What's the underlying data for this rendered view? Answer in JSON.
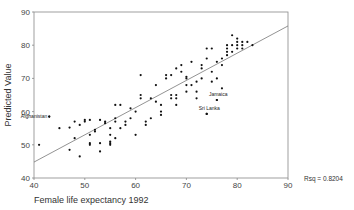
{
  "chart_data": {
    "type": "scatter",
    "title": "",
    "xlabel": "Female life expectancy 1992",
    "ylabel": "Predicted Value",
    "xlim": [
      40,
      90
    ],
    "ylim": [
      40,
      90
    ],
    "xticks": [
      40,
      50,
      60,
      70,
      80,
      90
    ],
    "yticks": [
      40,
      50,
      60,
      70,
      80,
      90
    ],
    "grid": false,
    "legend": null,
    "fit_line": {
      "x": [
        40,
        90
      ],
      "y": [
        44.8,
        85.8
      ]
    },
    "rsq_label": "Rsq = 0.8204",
    "annotations": [
      {
        "label": "Afghanistan",
        "x": 43,
        "y": 58.5
      },
      {
        "label": "Jamaica",
        "x": 76,
        "y": 63.5
      },
      {
        "label": "Sri Lanka",
        "x": 74,
        "y": 59.3
      }
    ],
    "points": [
      [
        41,
        50
      ],
      [
        43,
        58.5
      ],
      [
        45,
        55
      ],
      [
        47,
        55.2
      ],
      [
        47,
        48.5
      ],
      [
        48,
        57
      ],
      [
        48,
        52
      ],
      [
        49,
        56
      ],
      [
        49,
        46.5
      ],
      [
        50,
        57.5
      ],
      [
        50,
        57
      ],
      [
        51,
        57.5
      ],
      [
        51,
        50.5
      ],
      [
        51,
        50
      ],
      [
        51,
        53
      ],
      [
        52,
        54
      ],
      [
        52,
        54.5
      ],
      [
        53,
        57.5
      ],
      [
        53,
        50.5
      ],
      [
        53,
        48
      ],
      [
        54,
        56.5
      ],
      [
        54,
        57
      ],
      [
        55,
        55
      ],
      [
        55,
        53
      ],
      [
        55,
        50.5
      ],
      [
        55,
        50
      ],
      [
        55,
        51
      ],
      [
        56,
        62
      ],
      [
        56,
        57
      ],
      [
        56,
        58
      ],
      [
        56,
        52
      ],
      [
        57,
        55
      ],
      [
        57,
        62
      ],
      [
        58,
        56
      ],
      [
        58,
        57
      ],
      [
        59,
        61
      ],
      [
        59,
        58
      ],
      [
        60,
        60
      ],
      [
        60,
        53
      ],
      [
        61,
        71
      ],
      [
        61,
        65
      ],
      [
        61,
        64
      ],
      [
        62,
        56
      ],
      [
        62,
        57
      ],
      [
        63,
        58
      ],
      [
        63,
        64
      ],
      [
        64,
        68
      ],
      [
        64,
        63
      ],
      [
        65,
        62
      ],
      [
        65,
        59
      ],
      [
        65,
        60
      ],
      [
        66,
        70
      ],
      [
        66,
        71
      ],
      [
        67,
        64
      ],
      [
        67,
        65
      ],
      [
        67,
        71
      ],
      [
        68,
        64
      ],
      [
        68,
        65
      ],
      [
        68,
        73
      ],
      [
        68,
        62
      ],
      [
        69,
        74
      ],
      [
        69,
        72
      ],
      [
        70,
        70
      ],
      [
        70,
        68
      ],
      [
        70,
        66
      ],
      [
        70,
        70.5
      ],
      [
        71,
        75
      ],
      [
        71,
        68
      ],
      [
        72,
        69
      ],
      [
        72,
        64
      ],
      [
        72,
        66
      ],
      [
        73,
        73
      ],
      [
        73,
        70
      ],
      [
        73,
        74
      ],
      [
        74,
        76
      ],
      [
        74,
        79
      ],
      [
        74,
        59.3
      ],
      [
        75,
        72
      ],
      [
        75,
        69
      ],
      [
        75,
        79
      ],
      [
        76,
        70
      ],
      [
        76,
        63.5
      ],
      [
        76,
        75
      ],
      [
        77,
        74
      ],
      [
        77,
        67
      ],
      [
        77,
        76
      ],
      [
        78,
        79
      ],
      [
        78,
        77
      ],
      [
        78,
        78
      ],
      [
        78,
        80
      ],
      [
        79,
        80
      ],
      [
        79,
        83
      ],
      [
        79,
        78
      ],
      [
        80,
        81
      ],
      [
        80,
        79
      ],
      [
        80,
        80
      ],
      [
        80,
        82
      ],
      [
        81,
        81
      ],
      [
        81,
        80
      ],
      [
        81,
        79
      ],
      [
        82,
        81
      ],
      [
        83,
        80
      ]
    ]
  }
}
